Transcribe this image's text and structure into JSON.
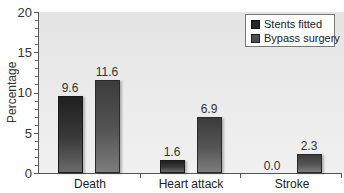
{
  "chart_data": {
    "type": "bar",
    "title": "",
    "xlabel": "",
    "ylabel": "Percentage",
    "ylim": [
      0,
      20
    ],
    "yticks": [
      0,
      5,
      10,
      15,
      20
    ],
    "grid": false,
    "legend_position": "top-right",
    "categories": [
      "Death",
      "Heart attack",
      "Stroke"
    ],
    "series": [
      {
        "name": "Stents fitted",
        "values": [
          9.6,
          1.6,
          0.0
        ],
        "labels": [
          "9.6",
          "1.6",
          "0.0"
        ],
        "color": "#2a2a2a"
      },
      {
        "name": "Bypass surgery",
        "values": [
          11.6,
          6.9,
          2.3
        ],
        "labels": [
          "11.6",
          "6.9",
          "2.3"
        ],
        "color": "#505050"
      }
    ]
  },
  "axis": {
    "y_label": "Percentage",
    "y_ticks": [
      "0",
      "5",
      "10",
      "15",
      "20"
    ]
  },
  "legend": {
    "items": [
      {
        "label": "Stents fitted"
      },
      {
        "label": "Bypass surgery"
      }
    ]
  },
  "categories": [
    {
      "label": "Death",
      "stent_label": "9.6",
      "bypass_label": "11.6"
    },
    {
      "label": "Heart attack",
      "stent_label": "1.6",
      "bypass_label": "6.9"
    },
    {
      "label": "Stroke",
      "stent_label": "0.0",
      "bypass_label": "2.3"
    }
  ]
}
